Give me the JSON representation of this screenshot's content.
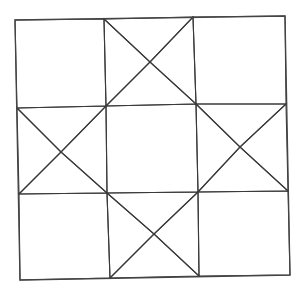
{
  "diagram": {
    "grid": "3x3",
    "colors": {
      "background": "#ffffff",
      "dark_fabric": "#595959",
      "dark_fabric_dot": "#2e2e2e",
      "light_fabric": "#ffffff",
      "line": "#3a3a3a"
    },
    "grid_points": {
      "row0": [
        [
          15,
          20
        ],
        [
          104,
          19
        ],
        [
          193,
          17
        ],
        [
          285,
          16
        ]
      ],
      "row1": [
        [
          17,
          108
        ],
        [
          106,
          106
        ],
        [
          196,
          104
        ],
        [
          286,
          104
        ]
      ],
      "row2": [
        [
          19,
          194
        ],
        [
          107,
          193
        ],
        [
          198,
          192
        ],
        [
          288,
          191
        ]
      ],
      "row3": [
        [
          20,
          280
        ],
        [
          110,
          278
        ],
        [
          199,
          276
        ],
        [
          290,
          275
        ]
      ]
    },
    "star_point_centers": {
      "top": [
        150,
        62
      ],
      "left": [
        61,
        152
      ],
      "right": [
        240,
        147
      ],
      "bottom": [
        154,
        234
      ]
    },
    "patches": [
      {
        "name": "corner-top-left",
        "shape": "square",
        "fabric": "light"
      },
      {
        "name": "hourglass-top",
        "shape": "quarter-square triangles",
        "fabric": "dark left/right, light top/bottom"
      },
      {
        "name": "corner-top-right",
        "shape": "square",
        "fabric": "light"
      },
      {
        "name": "hourglass-left",
        "shape": "quarter-square triangles",
        "fabric": "dark top/bottom, light left/right"
      },
      {
        "name": "center-square",
        "shape": "square",
        "fabric": "dark"
      },
      {
        "name": "hourglass-right",
        "shape": "quarter-square triangles",
        "fabric": "dark top/bottom, light left/right"
      },
      {
        "name": "corner-bottom-left",
        "shape": "square",
        "fabric": "light"
      },
      {
        "name": "hourglass-bottom",
        "shape": "quarter-square triangles",
        "fabric": "dark left/right, light top/bottom"
      },
      {
        "name": "corner-bottom-right",
        "shape": "square",
        "fabric": "light"
      }
    ]
  }
}
